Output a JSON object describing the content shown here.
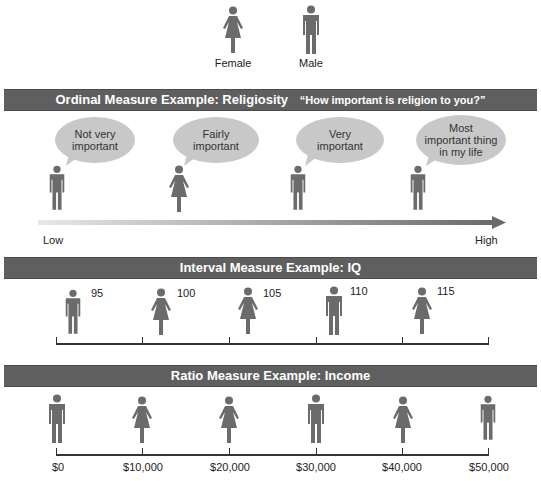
{
  "legend": {
    "female_label": "Female",
    "male_label": "Male"
  },
  "ordinal": {
    "title": "Ordinal Measure Example:  Religiosity",
    "question": "“How important is religion to you?”",
    "responses": [
      {
        "lines": [
          "Not very",
          "important"
        ],
        "figure": "male"
      },
      {
        "lines": [
          "Fairly",
          "important"
        ],
        "figure": "female"
      },
      {
        "lines": [
          "Very",
          "important"
        ],
        "figure": "male"
      },
      {
        "lines": [
          "Most",
          "important thing",
          "in my life"
        ],
        "figure": "male"
      }
    ],
    "scale_low": "Low",
    "scale_high": "High"
  },
  "interval": {
    "title": "Interval Measure Example:  IQ",
    "values": [
      "95",
      "100",
      "105",
      "110",
      "115"
    ],
    "figures": [
      "male",
      "female",
      "female",
      "male",
      "female"
    ]
  },
  "ratio": {
    "title": "Ratio Measure Example:  Income",
    "values": [
      "$0",
      "$10,000",
      "$20,000",
      "$30,000",
      "$40,000",
      "$50,000"
    ],
    "figures": [
      "male",
      "female",
      "female",
      "male",
      "female",
      "male"
    ]
  },
  "colors": {
    "bar": "#5f5f5f",
    "figure": "#6b6b6b",
    "bubble": "#c8c8c8"
  }
}
